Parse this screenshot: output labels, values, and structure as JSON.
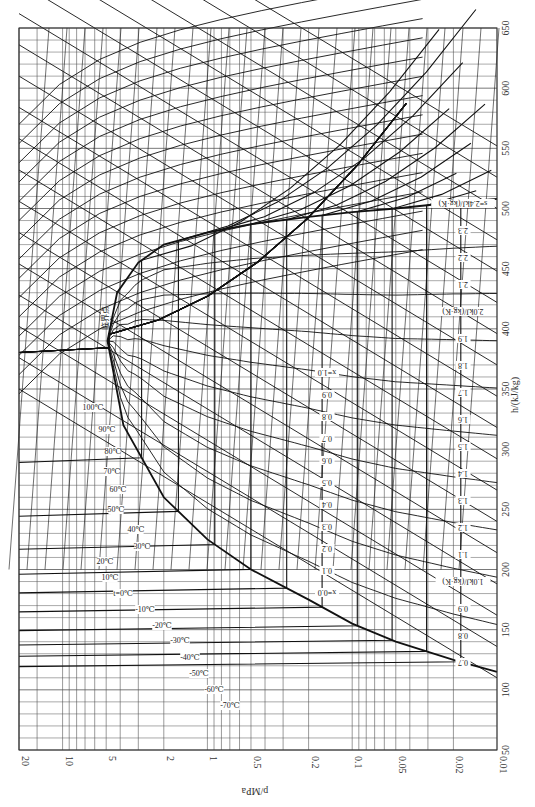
{
  "chart_data": {
    "type": "line",
    "orientation": "rotated 90° clockwise (pressure axis along bottom, enthalpy axis along right)",
    "xlabel": "h/(kJ/kg)",
    "ylabel": "p/MPa",
    "xlim": [
      50,
      650
    ],
    "ylim": [
      0.01,
      20
    ],
    "yscale": "log",
    "h_ticks": [
      50,
      100,
      150,
      200,
      250,
      300,
      350,
      400,
      450,
      500,
      550,
      600,
      650
    ],
    "p_ticks": [
      "20",
      "10",
      "5",
      "2",
      "1",
      "0.5",
      "0.2",
      "0.1",
      "0.05",
      "0.02",
      "0.01"
    ],
    "p_tick_values": [
      20,
      10,
      5,
      2,
      1,
      0.5,
      0.2,
      0.1,
      0.05,
      0.02,
      0.01
    ],
    "critical_point": {
      "label": "临界点",
      "p": 4.9,
      "h": 390
    },
    "saturation_dome": {
      "liquid_line": [
        [
          115,
          0.01
        ],
        [
          125,
          0.02
        ],
        [
          140,
          0.05
        ],
        [
          155,
          0.1
        ],
        [
          175,
          0.2
        ],
        [
          200,
          0.5
        ],
        [
          225,
          1.0
        ],
        [
          260,
          2.0
        ],
        [
          320,
          3.8
        ],
        [
          390,
          4.9
        ]
      ],
      "vapor_line": [
        [
          390,
          4.9
        ],
        [
          430,
          4.2
        ],
        [
          455,
          3.0
        ],
        [
          470,
          2.0
        ],
        [
          480,
          1.0
        ],
        [
          487,
          0.5
        ],
        [
          493,
          0.2
        ],
        [
          497,
          0.1
        ],
        [
          500,
          0.05
        ],
        [
          505,
          0.02
        ],
        [
          508,
          0.01
        ]
      ]
    },
    "isotherms_labels": [
      "-70℃",
      "-60℃",
      "-50℃",
      "-40℃",
      "-30℃",
      "-20℃",
      "-10℃",
      "t=0℃",
      "10℃",
      "20℃",
      "30℃",
      "40℃",
      "50℃",
      "60℃",
      "70℃",
      "80℃",
      "90℃",
      "100℃",
      "110℃",
      "120℃",
      "130℃",
      "140℃",
      "150℃",
      "160℃",
      "170℃",
      "180℃",
      "190℃",
      "200℃",
      "210℃",
      "220℃",
      "230℃",
      "240℃",
      "250℃"
    ],
    "quality_labels": [
      "x=0.0",
      "0.1",
      "0.2",
      "0.3",
      "0.4",
      "0.5",
      "0.6",
      "0.7",
      "0.8",
      "0.9",
      "x=1.0"
    ],
    "entropy_labels": [
      "0.7",
      "0.8",
      "0.9",
      "1.0kJ/(kg·K)",
      "1.1",
      "1.2",
      "1.3",
      "1.4",
      "1.5",
      "1.6",
      "1.7",
      "1.8",
      "1.9",
      "2.0kJ/(kg·K)",
      "2.1",
      "2.2",
      "2.3",
      "s=2.4kJ/(kg·K)"
    ],
    "specific_volume_labels": [
      "0.0007",
      "0.00075",
      "0.0008",
      "0.00085",
      "0.0009",
      "0.00095",
      "0.001m³/kg",
      "0.0011",
      "0.0012",
      "0.0013",
      "0.0014",
      "0.0015",
      "0.002",
      "0.003",
      "0.004",
      "0.005",
      "0.006",
      "0.007",
      "0.008",
      "0.009",
      "0.01",
      "0.015",
      "0.02m³/kg",
      "0.025",
      "0.03",
      "0.04",
      "0.05",
      "0.06",
      "0.07",
      "0.08",
      "0.09",
      "0.10",
      "0.15",
      "0.2",
      "0.3",
      "0.4",
      "0.5",
      "0.6",
      "0.7m³/kg",
      "0.8",
      "0.9",
      "1.0",
      "1.5",
      "2.0",
      "2.5",
      "3.0m³/kg",
      "4.0"
    ],
    "grid": true,
    "legend": null
  },
  "axes": {
    "h_label": "h/(kJ/kg)",
    "p_label": "p/MPa"
  },
  "colors": {
    "grid": "#555555",
    "curve": "#111111",
    "background": "#ffffff"
  }
}
